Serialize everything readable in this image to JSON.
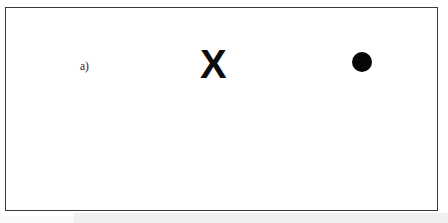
{
  "figure": {
    "background_color": "#ffffff",
    "frame_color": "#3a3a3a",
    "ink_color": "#0d0d0d",
    "panels": [
      {
        "id": "a",
        "label": "a)",
        "target_symbol": "X",
        "target_size": "large",
        "has_mask": false,
        "mask_description": "",
        "probe_symbol": "●",
        "probe_description": "filled black circle"
      },
      {
        "id": "b",
        "label": "b)",
        "target_symbol": "X",
        "target_size": "small",
        "has_mask": true,
        "mask_description": "vertical line grating overlaying the target",
        "probe_symbol": "●",
        "probe_description": "filled black circle"
      }
    ],
    "grating": {
      "bar_count": 13,
      "bar_color": "#111111",
      "orientation": "vertical"
    }
  }
}
